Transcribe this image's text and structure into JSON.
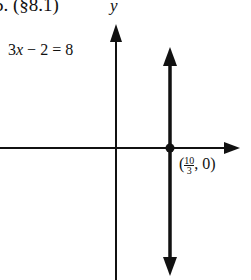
{
  "header": {
    "label": "5. (§8.1)"
  },
  "axes": {
    "y_label": "y",
    "x_label": "x"
  },
  "equation": {
    "lhs_coef": "3",
    "lhs_var": "x",
    "rest": " − 2 = 8"
  },
  "point": {
    "open": "(",
    "num": "10",
    "den": "3",
    "rest": ", 0)"
  },
  "colors": {
    "ink": "#111111",
    "background": "#ffffff"
  }
}
